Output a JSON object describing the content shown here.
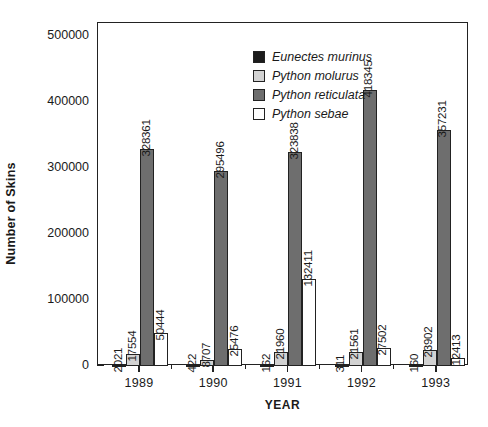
{
  "chart_data": {
    "type": "bar",
    "title": "",
    "xlabel": "YEAR",
    "ylabel": "Number of Skins",
    "categories": [
      "1989",
      "1990",
      "1991",
      "1992",
      "1993"
    ],
    "ylim": [
      0,
      520000
    ],
    "yticks": [
      0,
      100000,
      200000,
      300000,
      400000,
      500000
    ],
    "ytick_labels": [
      "0",
      "100000",
      "200000",
      "300000",
      "400000",
      "500000"
    ],
    "minor_yticks": [
      50000,
      150000,
      250000,
      350000,
      450000
    ],
    "grid": false,
    "legend_position": "top-center-inside",
    "series": [
      {
        "name": "Eunectes murinus",
        "color": "#1c1c1c",
        "values": [
          2021,
          422,
          162,
          311,
          160
        ],
        "labels": [
          "2021",
          "422",
          "162",
          "311",
          "160"
        ]
      },
      {
        "name": "Python molurus",
        "color": "#d2d2d2",
        "values": [
          17554,
          8707,
          21960,
          21561,
          23902
        ],
        "labels": [
          "17554",
          "8707",
          "21960",
          "21561",
          "23902"
        ]
      },
      {
        "name": "Python reticulata",
        "color": "#6e6e6e",
        "values": [
          328361,
          295496,
          323838,
          418345,
          357231
        ],
        "labels": [
          "328361",
          "295496",
          "323838",
          "418345",
          "357231"
        ]
      },
      {
        "name": "Python sebae",
        "color": "#ffffff",
        "values": [
          50444,
          25476,
          132411,
          27502,
          12413
        ],
        "labels": [
          "50444",
          "25476",
          "132411",
          "27502",
          "12413"
        ]
      }
    ]
  },
  "legend": {
    "items": [
      {
        "label": "Eunectes murinus"
      },
      {
        "label": "Python molurus"
      },
      {
        "label": "Python reticulata"
      },
      {
        "label": "Python sebae"
      }
    ]
  },
  "axes": {
    "y_title": "Number of Skins",
    "x_title": "YEAR",
    "y_labels": [
      "500000",
      "400000",
      "300000",
      "200000",
      "100000",
      "0"
    ],
    "x_labels": [
      "1989",
      "1990",
      "1991",
      "1992",
      "1993"
    ]
  }
}
